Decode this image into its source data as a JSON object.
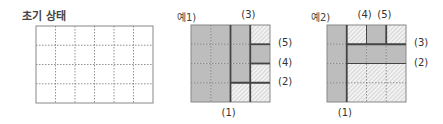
{
  "panels": [
    {
      "title": "초기 상태",
      "rows": 4,
      "cols": 6,
      "cells": [
        [
          "w",
          "w",
          "w",
          "w",
          "w",
          "w"
        ],
        [
          "w",
          "w",
          "w",
          "w",
          "w",
          "w"
        ],
        [
          "w",
          "w",
          "w",
          "w",
          "w",
          "w"
        ],
        [
          "w",
          "w",
          "w",
          "w",
          "w",
          "w"
        ]
      ],
      "cuts": [],
      "labels": []
    },
    {
      "title": "예1)",
      "rows": 4,
      "cols": 4,
      "cells": [
        [
          "g",
          "g",
          "g",
          "h"
        ],
        [
          "g",
          "g",
          "g",
          "g"
        ],
        [
          "g",
          "g",
          "g",
          "h"
        ],
        [
          "g",
          "g",
          "h",
          "h"
        ]
      ],
      "cuts": [
        {
          "type": "v",
          "at": 2,
          "from": 0,
          "to": 4,
          "label": "(1)",
          "label_side": "bottom"
        },
        {
          "type": "h",
          "at": 3,
          "from": 2,
          "to": 4,
          "label": "(2)",
          "label_side": "right"
        },
        {
          "type": "v",
          "at": 3,
          "from": 0,
          "to": 4,
          "label": "(3)",
          "label_side": "top"
        },
        {
          "type": "h",
          "at": 2,
          "from": 3,
          "to": 4,
          "label": "(4)",
          "label_side": "right"
        },
        {
          "type": "h",
          "at": 1,
          "from": 3,
          "to": 4,
          "label": "(5)",
          "label_side": "right"
        }
      ]
    },
    {
      "title": "예2)",
      "rows": 4,
      "cols": 4,
      "cells": [
        [
          "g",
          "h",
          "g",
          "h"
        ],
        [
          "g",
          "g",
          "g",
          "g"
        ],
        [
          "g",
          "h",
          "h",
          "h"
        ],
        [
          "g",
          "h",
          "h",
          "h"
        ]
      ],
      "cuts": [
        {
          "type": "v",
          "at": 1,
          "from": 0,
          "to": 4,
          "label": "(1)",
          "label_side": "bottom"
        },
        {
          "type": "h",
          "at": 2,
          "from": 1,
          "to": 4,
          "label": "(2)",
          "label_side": "right",
          "thin": true
        },
        {
          "type": "h",
          "at": 1,
          "from": 1,
          "to": 4,
          "label": "(3)",
          "label_side": "right"
        },
        {
          "type": "v",
          "at": 2,
          "from": 0,
          "to": 1,
          "label": "(4)",
          "label_side": "top",
          "thin": true
        },
        {
          "type": "v",
          "at": 3,
          "from": 0,
          "to": 1,
          "label": "(5)",
          "label_side": "top"
        }
      ]
    }
  ],
  "colors": {
    "gray": "#bdbdbd",
    "hatch_bg": "#f0f0f0",
    "hatch_line": "#aaaaaa",
    "border": "#888888",
    "cut": "#444444",
    "dotted": "#777777"
  }
}
